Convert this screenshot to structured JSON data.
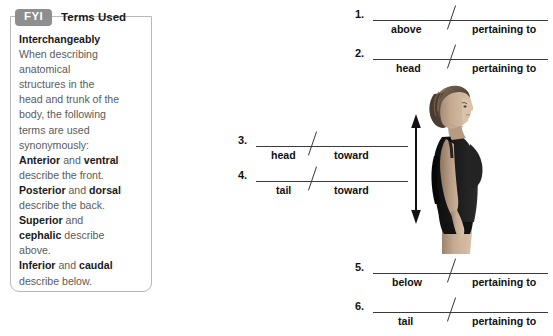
{
  "callout": {
    "badge": "FYI",
    "title": "Terms Used",
    "lines": [
      {
        "text": "Interchangeably",
        "bold": true
      },
      {
        "text": "When describing",
        "bold": false
      },
      {
        "text": "anatomical",
        "bold": false
      },
      {
        "text": "structures in the",
        "bold": false
      },
      {
        "text": "head and trunk of the",
        "bold": false
      },
      {
        "text": "body, the following",
        "bold": false
      },
      {
        "text": "terms are used",
        "bold": false
      },
      {
        "text": "synonymously:",
        "bold": false
      }
    ],
    "pairs": [
      {
        "term1": "Anterior",
        "conj": " and ",
        "term2": "ventral",
        "desc": "describe the front."
      },
      {
        "term1": "Posterior",
        "conj": " and ",
        "term2": "dorsal",
        "desc": "describe the back."
      },
      {
        "term1": "Superior",
        "conj": " and ",
        "term2": "cephalic",
        "desc": "describe above."
      },
      {
        "term1": "Inferior",
        "conj": " and ",
        "term2": "caudal",
        "desc": "describe below."
      }
    ],
    "badge_color": "#8e8e8e",
    "border_color": "#b9b9b9"
  },
  "items": [
    {
      "number": "1.",
      "cue_left": "above",
      "cue_right": "pertaining to"
    },
    {
      "number": "2.",
      "cue_left": "head",
      "cue_right": "pertaining to"
    },
    {
      "number": "3.",
      "cue_left": "head",
      "cue_right": "toward"
    },
    {
      "number": "4.",
      "cue_left": "tail",
      "cue_right": "toward"
    },
    {
      "number": "5.",
      "cue_left": "below",
      "cue_right": "pertaining to"
    },
    {
      "number": "6.",
      "cue_left": "tail",
      "cue_right": "pertaining to"
    }
  ],
  "figure": {
    "name": "standing-woman-lateral-view",
    "arrow": "vertical-double-headed-arrow",
    "hair_color": "#6b5a4a",
    "garment_color": "#1a1a1a",
    "skin_color": "#c9a98e"
  }
}
